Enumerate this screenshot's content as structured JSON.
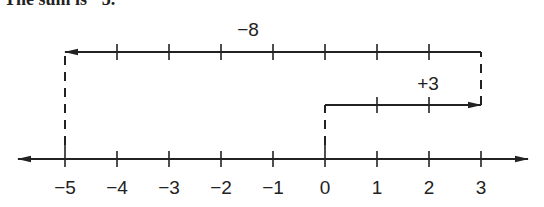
{
  "caption": "The sum is −5.",
  "number_line": {
    "min": -5,
    "max": 3,
    "tick_labels": [
      "−5",
      "−4",
      "−3",
      "−2",
      "−1",
      "0",
      "1",
      "2",
      "3"
    ],
    "line_color": "#222222"
  },
  "moves": [
    {
      "label": "+3",
      "from": 0,
      "to": 3
    },
    {
      "label": "−8",
      "from": 3,
      "to": -5
    }
  ],
  "chart_data": {
    "type": "number-line",
    "title": "",
    "range": [
      -5,
      3
    ],
    "ticks": [
      -5,
      -4,
      -3,
      -2,
      -1,
      0,
      1,
      2,
      3
    ],
    "arrows": [
      {
        "label": "+3",
        "start": 0,
        "end": 3
      },
      {
        "label": "−8",
        "start": 3,
        "end": -5
      }
    ],
    "result": -5
  }
}
